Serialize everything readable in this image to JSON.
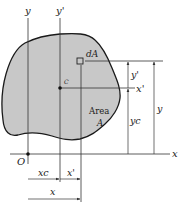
{
  "diagram": {
    "colors": {
      "area_fill": "#c8c8c8",
      "outline": "#1a1a1a",
      "line": "#333333",
      "background": "#ffffff"
    },
    "labels": {
      "y_axis": "y",
      "y_prime_axis": "y'",
      "x_axis": "x",
      "x_prime_axis": "x'",
      "origin": "O",
      "centroid": "C",
      "element": "dA",
      "area_line1": "Area",
      "area_line2": "A",
      "dim_y_prime": "y'",
      "dim_y_c": "yc",
      "dim_y": "y",
      "dim_x_c": "xc",
      "dim_x_prime": "x'",
      "dim_x": "x"
    }
  }
}
